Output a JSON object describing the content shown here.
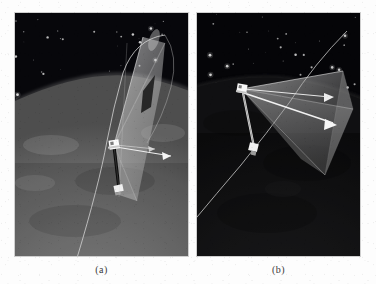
{
  "figure": {
    "title": "",
    "background_color": "#fdfdfd",
    "width": 376,
    "height": 284
  },
  "panels": [
    {
      "id": "a",
      "caption": "(a)",
      "x": 14,
      "y": 12,
      "width": 175,
      "height": 245,
      "scene": {
        "description": "satellite sensor field-of-view cone above sunlit Earth limb with starfield",
        "sky_color": "#05050a",
        "earth_color": "#6f6f6f",
        "earth_terminator_shade": "#555555",
        "cone_color": "#c9c9c9",
        "cone_opacity": 0.55,
        "orbit_track_color": "#c8c8c8",
        "axis_arrow_color": "#e6e6e6",
        "boom_color": "#0a0a0a",
        "satellite_body_color": "#f2f2f2",
        "star_color": "#dedede",
        "star_count": 46,
        "satellite_label": "",
        "vectors": [
          {
            "name": "velocity-vector",
            "direction": "right",
            "color": "#ececec"
          },
          {
            "name": "nadir-boom-vector",
            "direction": "down-left",
            "color": "#141414"
          }
        ]
      }
    },
    {
      "id": "b",
      "caption": "(b)",
      "x": 196,
      "y": 12,
      "width": 165,
      "height": 245,
      "scene": {
        "description": "same satellite sensor cone seen from a second viewpoint over the night side of Earth",
        "sky_color": "#040407",
        "earth_color": "#1b1b1d",
        "earth_terminator_shade": "#121214",
        "cone_color": "#9a9a9a",
        "cone_opacity": 0.62,
        "orbit_track_color": "#bdbdbd",
        "axis_arrow_color": "#f0f0f0",
        "boom_color": "#d8d8d8",
        "satellite_body_color": "#efefef",
        "star_color": "#d6d6d6",
        "star_count": 38,
        "satellite_label": "",
        "vectors": [
          {
            "name": "velocity-vector",
            "direction": "right",
            "color": "#f2f2f2"
          },
          {
            "name": "boresight-vector",
            "direction": "right-up",
            "color": "#e4e4e4"
          },
          {
            "name": "nadir-boom-vector",
            "direction": "down",
            "color": "#dcdcdc"
          }
        ]
      }
    }
  ],
  "captions": {
    "a": "(a)",
    "b": "(b)"
  }
}
